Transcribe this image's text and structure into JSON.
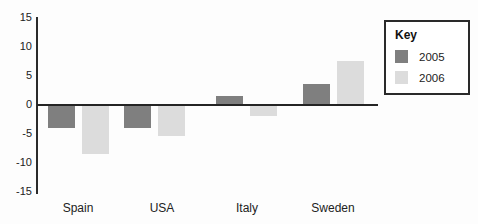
{
  "chart_data": {
    "type": "bar",
    "title": "",
    "categories": [
      "Spain",
      "USA",
      "Italy",
      "Sweden"
    ],
    "series": [
      {
        "name": "2005",
        "color": "#7f7f7f",
        "values": [
          -4,
          -4,
          1.5,
          3.5
        ]
      },
      {
        "name": "2006",
        "color": "#dcdcdc",
        "values": [
          -8.5,
          -5.5,
          -2,
          7.5
        ]
      }
    ],
    "xlabel": "",
    "ylabel": "",
    "ylim": [
      -15,
      15
    ],
    "yticks": [
      15,
      10,
      5,
      0,
      -5,
      -10,
      -15
    ],
    "grid": false,
    "legend": {
      "title": "Key",
      "position": "top-right"
    },
    "colors": {
      "axis": "#2b2b2b",
      "text": "#222222",
      "background": "#fdfdfd"
    }
  }
}
